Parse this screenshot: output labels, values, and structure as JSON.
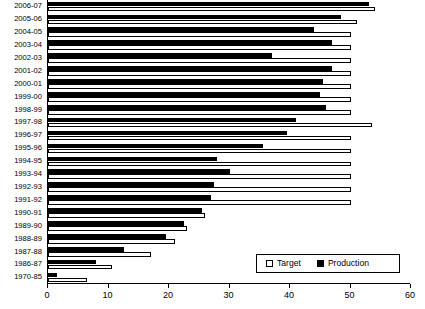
{
  "chart_data": {
    "type": "bar",
    "orientation": "horizontal",
    "title": "",
    "xlabel": "",
    "ylabel": "",
    "xlim": [
      0,
      60
    ],
    "xticks": [
      0,
      10,
      20,
      30,
      40,
      50,
      60
    ],
    "grid": false,
    "legend_position": "bottom-right",
    "categories": [
      "2006-07",
      "2005-06",
      "2004-05",
      "2003-04",
      "2002-03",
      "2001-02",
      "2000-01",
      "1999-00",
      "1998-99",
      "1997-98",
      "1996-97",
      "1995-96",
      "1994-95",
      "1993-94",
      "1992-93",
      "1991-92",
      "1990-91",
      "1989-90",
      "1988-89",
      "1987-88",
      "1986-87",
      "1970-85"
    ],
    "series": [
      {
        "name": "Target",
        "color": "#ffffff",
        "edge_color": "#000000",
        "values": [
          54.0,
          51.0,
          50.0,
          50.0,
          50.0,
          50.0,
          50.0,
          50.0,
          50.0,
          53.5,
          50.0,
          50.0,
          50.0,
          50.0,
          50.0,
          50.0,
          26.0,
          23.0,
          21.0,
          17.0,
          10.5,
          6.5
        ]
      },
      {
        "name": "Production",
        "color": "#000000",
        "edge_color": "#000000",
        "values": [
          53.0,
          48.5,
          44.0,
          47.0,
          37.0,
          47.0,
          45.5,
          45.0,
          46.0,
          41.0,
          39.5,
          35.5,
          28.0,
          30.0,
          27.5,
          27.0,
          25.5,
          22.5,
          19.5,
          12.5,
          8.0,
          1.5
        ]
      }
    ]
  },
  "legend": {
    "items": [
      {
        "label": "Target",
        "marker": "open-square"
      },
      {
        "label": "Production",
        "marker": "filled-square"
      }
    ]
  },
  "axis": {
    "x_tick_labels": [
      "0",
      "10",
      "20",
      "30",
      "40",
      "50",
      "60"
    ]
  }
}
